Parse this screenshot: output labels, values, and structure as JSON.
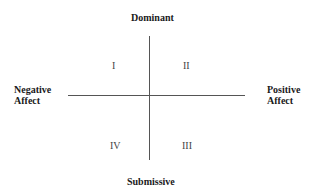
{
  "diagram": {
    "axes": {
      "top": "Dominant",
      "bottom": "Submissive",
      "left": [
        "Negative",
        "Affect"
      ],
      "right": [
        "Positive",
        "Affect"
      ]
    },
    "quadrants": {
      "top_left": "I",
      "top_right": "II",
      "bottom_right": "III",
      "bottom_left": "IV"
    }
  }
}
